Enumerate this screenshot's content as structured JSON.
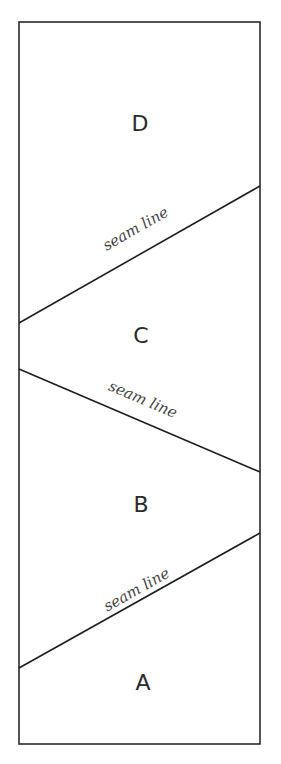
{
  "diagram": {
    "regions": [
      {
        "id": "D",
        "label": "D"
      },
      {
        "id": "C",
        "label": "C"
      },
      {
        "id": "B",
        "label": "B"
      },
      {
        "id": "A",
        "label": "A"
      }
    ],
    "seams": [
      {
        "label": "seam line",
        "between": [
          "D",
          "C"
        ]
      },
      {
        "label": "seam line",
        "between": [
          "C",
          "B"
        ]
      },
      {
        "label": "seam line",
        "between": [
          "B",
          "A"
        ]
      }
    ]
  },
  "colors": {
    "line": "#1e1e1e",
    "background": "#ffffff"
  }
}
